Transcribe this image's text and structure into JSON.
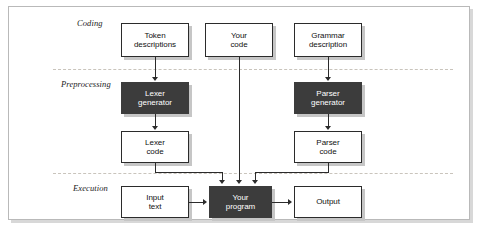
{
  "figure": {
    "background_color": "#ffffff",
    "frame_border_color": "#b9b9b9",
    "band_separator_color": "#c9c4bc",
    "node_dark_color": "#3c3c3c",
    "node_light_color": "#ffffff",
    "node_border_color": "#2b2b2b",
    "connector_color": "#2b2b2b",
    "shadow_color": "#c6c6c6"
  },
  "bands": [
    {
      "id": "coding",
      "label": "Coding"
    },
    {
      "id": "preprocessing",
      "label": "Preprocessing"
    },
    {
      "id": "execution",
      "label": "Execution"
    }
  ],
  "nodes": [
    {
      "id": "token-descriptions",
      "label": "Token\ndescriptions",
      "style": "light",
      "band": "coding"
    },
    {
      "id": "your-code",
      "label": "Your\ncode",
      "style": "light",
      "band": "coding"
    },
    {
      "id": "grammar-description",
      "label": "Grammar\ndescription",
      "style": "light",
      "band": "coding"
    },
    {
      "id": "lexer-generator",
      "label": "Lexer\ngenerator",
      "style": "dark",
      "band": "preprocessing"
    },
    {
      "id": "parser-generator",
      "label": "Parser\ngenerator",
      "style": "dark",
      "band": "preprocessing"
    },
    {
      "id": "lexer-code",
      "label": "Lexer\ncode",
      "style": "light",
      "band": "preprocessing"
    },
    {
      "id": "parser-code",
      "label": "Parser\ncode",
      "style": "light",
      "band": "preprocessing"
    },
    {
      "id": "input-text",
      "label": "Input\ntext",
      "style": "light",
      "band": "execution"
    },
    {
      "id": "your-program",
      "label": "Your\nprogram",
      "style": "dark",
      "band": "execution"
    },
    {
      "id": "output",
      "label": "Output",
      "style": "light",
      "band": "execution"
    }
  ],
  "edges": [
    {
      "from": "token-descriptions",
      "to": "lexer-generator",
      "direction": "down"
    },
    {
      "from": "grammar-description",
      "to": "parser-generator",
      "direction": "down"
    },
    {
      "from": "lexer-generator",
      "to": "lexer-code",
      "direction": "down"
    },
    {
      "from": "parser-generator",
      "to": "parser-code",
      "direction": "down"
    },
    {
      "from": "lexer-code",
      "to": "your-program",
      "direction": "down-right-down"
    },
    {
      "from": "your-code",
      "to": "your-program",
      "direction": "down"
    },
    {
      "from": "parser-code",
      "to": "your-program",
      "direction": "down-left-down"
    },
    {
      "from": "input-text",
      "to": "your-program",
      "direction": "right"
    },
    {
      "from": "your-program",
      "to": "output",
      "direction": "right"
    }
  ]
}
